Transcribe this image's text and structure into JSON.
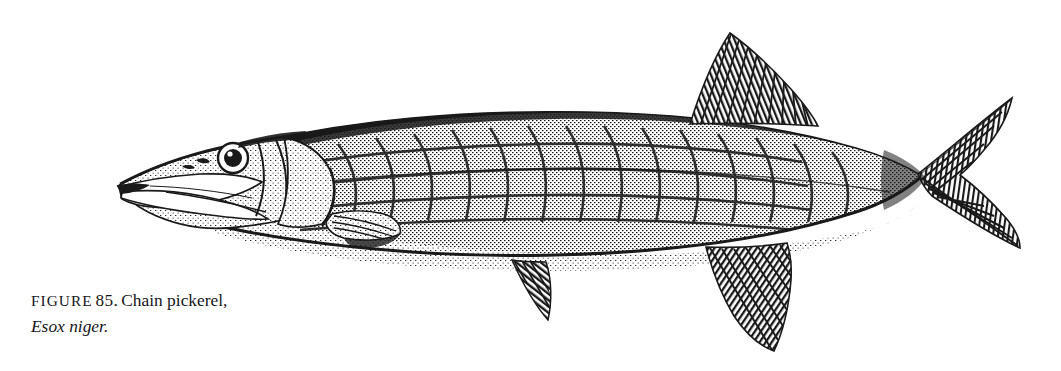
{
  "page": {
    "background_color": "#ffffff",
    "ink_color": "#1a1a1a",
    "width": 1061,
    "height": 371
  },
  "figure": {
    "caption_label": "Figure",
    "caption_number": "85.",
    "caption_title": "Chain pickerel,",
    "caption_species": "Esox niger.",
    "illustration_name": "chain-pickerel-engraving",
    "illustration_alt": "Black and white engraving of a chain pickerel facing left, showing duckbill snout, reticulated chain body pattern, dorsal fin set far back, and deeply forked tail.",
    "illustration_style": "line-engraving",
    "subject_orientation": "facing-left",
    "parts": [
      {
        "name": "snout",
        "label": "duckbill snout"
      },
      {
        "name": "eye",
        "label": "eye"
      },
      {
        "name": "operculum",
        "label": "gill cover"
      },
      {
        "name": "pectoral-fin",
        "label": "pectoral fin"
      },
      {
        "name": "pelvic-fin",
        "label": "pelvic fin"
      },
      {
        "name": "anal-fin",
        "label": "anal fin"
      },
      {
        "name": "dorsal-fin",
        "label": "dorsal fin"
      },
      {
        "name": "caudal-fin",
        "label": "forked caudal fin"
      },
      {
        "name": "body-chain-pattern",
        "label": "chain-link body markings"
      }
    ]
  }
}
